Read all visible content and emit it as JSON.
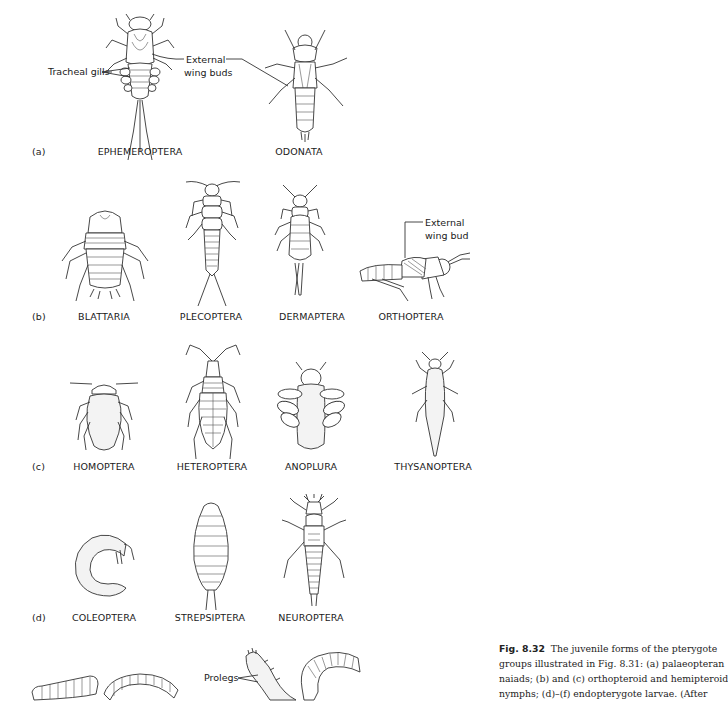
{
  "figure": {
    "number": "Fig. 8.32",
    "caption_lines": [
      "The juvenile forms of the pterygote",
      "groups illustrated in Fig. 8.31: (a) palaeopteran",
      "naiads; (b) and (c) orthopteroid and hemipteroid",
      "nymphs; (d)–(f) endopterygote larvae. (After"
    ]
  },
  "panels": {
    "a": {
      "label": "(a)",
      "specimens": [
        {
          "name": "EPHEMEROPTERA"
        },
        {
          "name": "ODONATA"
        }
      ],
      "annotations": {
        "tracheal_gills": "Tracheal gills",
        "external_wing_buds_1": "External",
        "external_wing_buds_2": "wing buds"
      }
    },
    "b": {
      "label": "(b)",
      "specimens": [
        {
          "name": "BLATTARIA"
        },
        {
          "name": "PLECOPTERA"
        },
        {
          "name": "DERMAPTERA"
        },
        {
          "name": "ORTHOPTERA"
        }
      ],
      "annotations": {
        "external_wing_bud_1": "External",
        "external_wing_bud_2": "wing bud"
      }
    },
    "c": {
      "label": "(c)",
      "specimens": [
        {
          "name": "HOMOPTERA"
        },
        {
          "name": "HETEROPTERA"
        },
        {
          "name": "ANOPLURA"
        },
        {
          "name": "THYSANOPTERA"
        }
      ]
    },
    "d": {
      "label": "(d)",
      "specimens": [
        {
          "name": "COLEOPTERA"
        },
        {
          "name": "STREPSIPTERA"
        },
        {
          "name": "NEUROPTERA"
        }
      ]
    },
    "bottom": {
      "annotations": {
        "prolegs": "Prolegs"
      }
    }
  }
}
